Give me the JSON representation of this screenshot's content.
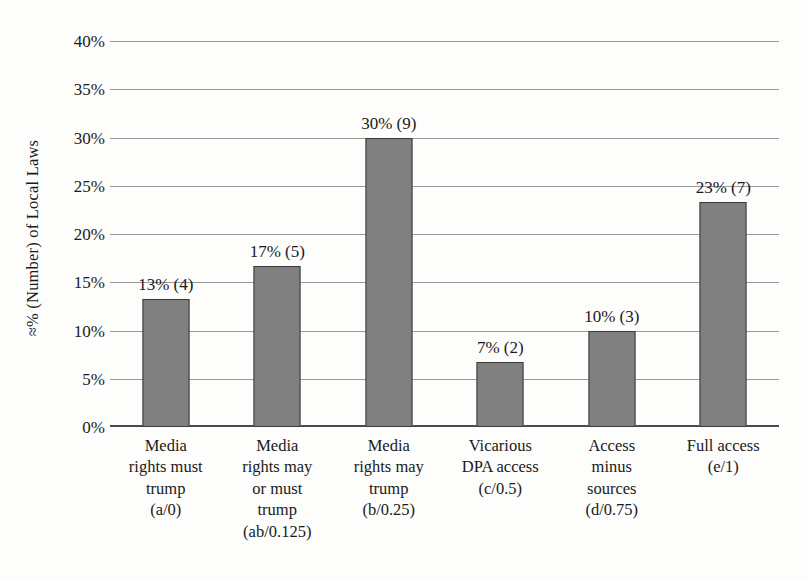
{
  "chart_data": {
    "type": "bar",
    "title": "",
    "xlabel": "",
    "ylabel": "≈% (Number) of Local Laws",
    "ylim": [
      0,
      40
    ],
    "grid": true,
    "legend": "none",
    "y_ticks": [
      "0%",
      "5%",
      "10%",
      "15%",
      "20%",
      "25%",
      "30%",
      "35%",
      "40%"
    ],
    "y_tick_values": [
      0,
      5,
      10,
      15,
      20,
      25,
      30,
      35,
      40
    ],
    "categories": [
      "Media\nrights must\ntrump\n(a/0)",
      "Media\nrights may\nor must\ntrump\n(ab/0.125)",
      "Media\nrights may\ntrump\n(b/0.25)",
      "Vicarious\nDPA access\n(c/0.5)",
      "Access\nminus\nsources\n(d/0.75)",
      "Full access\n(e/1)"
    ],
    "values": [
      13.3,
      16.7,
      30.0,
      6.7,
      10.0,
      23.3
    ],
    "counts": [
      4,
      5,
      9,
      2,
      3,
      7
    ],
    "data_labels": [
      "13% (4)",
      "17% (5)",
      "30% (9)",
      "7% (2)",
      "10% (3)",
      "23% (7)"
    ],
    "bar_color": "#808080",
    "bar_border_color": "#3a3a3a",
    "gridline_color": "#9a9a9a",
    "axis_color": "#4a4a4a"
  }
}
